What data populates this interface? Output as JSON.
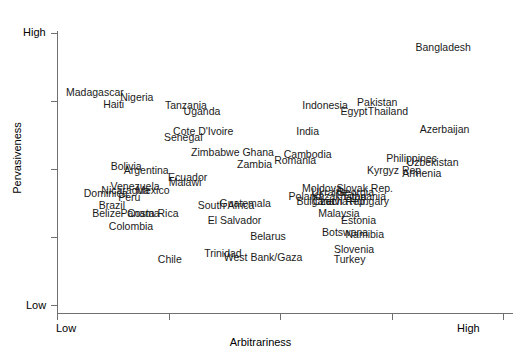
{
  "chart_data": {
    "type": "scatter",
    "title": "",
    "xlabel": "Arbitrariness",
    "ylabel": "Pervasiveness",
    "x_tick_labels": [
      "Low",
      "",
      "",
      "",
      "High"
    ],
    "y_tick_labels": [
      "High",
      "",
      "",
      "",
      "Low"
    ],
    "xlim": [
      "Low",
      "High"
    ],
    "ylim": [
      "Low",
      "High"
    ],
    "grid": false,
    "legend": "none",
    "note": "Text-label scatter: each country name is plotted at its (Arbitrariness, Pervasiveness) position. x/y given in normalized 0-1 units where 0=Low and 1=High.",
    "points": [
      {
        "label": "Bangladesh",
        "x": 0.866,
        "y": 0.948
      },
      {
        "label": "Madagascar",
        "x": 0.085,
        "y": 0.784
      },
      {
        "label": "Nigeria",
        "x": 0.179,
        "y": 0.766
      },
      {
        "label": "Haiti",
        "x": 0.127,
        "y": 0.738
      },
      {
        "label": "Tanzania",
        "x": 0.289,
        "y": 0.734
      },
      {
        "label": "Indonesia",
        "x": 0.601,
        "y": 0.734
      },
      {
        "label": "Pakistan",
        "x": 0.718,
        "y": 0.748
      },
      {
        "label": "Uganda",
        "x": 0.325,
        "y": 0.713
      },
      {
        "label": "Egypt",
        "x": 0.666,
        "y": 0.713
      },
      {
        "label": "Thailand",
        "x": 0.742,
        "y": 0.713
      },
      {
        "label": "Cote D'Ivoire",
        "x": 0.328,
        "y": 0.639
      },
      {
        "label": "India",
        "x": 0.562,
        "y": 0.639
      },
      {
        "label": "Azerbaijan",
        "x": 0.869,
        "y": 0.646
      },
      {
        "label": "Senegal",
        "x": 0.283,
        "y": 0.618
      },
      {
        "label": "Zimbabwe",
        "x": 0.355,
        "y": 0.561
      },
      {
        "label": "Ghana",
        "x": 0.451,
        "y": 0.561
      },
      {
        "label": "Cambodia",
        "x": 0.562,
        "y": 0.554
      },
      {
        "label": "Philippines",
        "x": 0.795,
        "y": 0.54
      },
      {
        "label": "Romania",
        "x": 0.534,
        "y": 0.533
      },
      {
        "label": "Uzbekistan",
        "x": 0.842,
        "y": 0.526
      },
      {
        "label": "Zambia",
        "x": 0.443,
        "y": 0.519
      },
      {
        "label": "Bolivia",
        "x": 0.155,
        "y": 0.512
      },
      {
        "label": "Argentina",
        "x": 0.2,
        "y": 0.498
      },
      {
        "label": "Kyrgyz Rep.",
        "x": 0.759,
        "y": 0.498
      },
      {
        "label": "Armenia",
        "x": 0.818,
        "y": 0.484
      },
      {
        "label": "Ecuador",
        "x": 0.293,
        "y": 0.47
      },
      {
        "label": "Malawi",
        "x": 0.287,
        "y": 0.452
      },
      {
        "label": "Venezuela",
        "x": 0.175,
        "y": 0.438
      },
      {
        "label": "Moldova",
        "x": 0.594,
        "y": 0.431
      },
      {
        "label": "Slovak Rep.",
        "x": 0.69,
        "y": 0.431
      },
      {
        "label": "Nicaragua",
        "x": 0.153,
        "y": 0.424
      },
      {
        "label": "Mexico",
        "x": 0.215,
        "y": 0.424
      },
      {
        "label": "Ukraine",
        "x": 0.611,
        "y": 0.417
      },
      {
        "label": "Georgia",
        "x": 0.669,
        "y": 0.417
      },
      {
        "label": "Dominica",
        "x": 0.109,
        "y": 0.41
      },
      {
        "label": "Poland",
        "x": 0.556,
        "y": 0.4
      },
      {
        "label": "Kazakhstan",
        "x": 0.632,
        "y": 0.4
      },
      {
        "label": "Lithuania",
        "x": 0.69,
        "y": 0.4
      },
      {
        "label": "Peru",
        "x": 0.162,
        "y": 0.396
      },
      {
        "label": "Bulgaria",
        "x": 0.58,
        "y": 0.382
      },
      {
        "label": "Czech Rep.",
        "x": 0.635,
        "y": 0.382
      },
      {
        "label": "Latvia",
        "x": 0.621,
        "y": 0.382
      },
      {
        "label": "Hungary",
        "x": 0.7,
        "y": 0.382
      },
      {
        "label": "Brazil",
        "x": 0.123,
        "y": 0.368
      },
      {
        "label": "South Africa",
        "x": 0.379,
        "y": 0.368
      },
      {
        "label": "Guatemala",
        "x": 0.422,
        "y": 0.375
      },
      {
        "label": "Belize",
        "x": 0.111,
        "y": 0.34
      },
      {
        "label": "Panama",
        "x": 0.186,
        "y": 0.34
      },
      {
        "label": "Costa Rica",
        "x": 0.215,
        "y": 0.34
      },
      {
        "label": "Malaysia",
        "x": 0.632,
        "y": 0.34
      },
      {
        "label": "El Salvador",
        "x": 0.398,
        "y": 0.312
      },
      {
        "label": "Estonia",
        "x": 0.676,
        "y": 0.312
      },
      {
        "label": "Colombia",
        "x": 0.166,
        "y": 0.291
      },
      {
        "label": "Botswana",
        "x": 0.646,
        "y": 0.269
      },
      {
        "label": "Namibia",
        "x": 0.69,
        "y": 0.262
      },
      {
        "label": "Belarus",
        "x": 0.473,
        "y": 0.255
      },
      {
        "label": "Slovenia",
        "x": 0.666,
        "y": 0.206
      },
      {
        "label": "Trinidad",
        "x": 0.372,
        "y": 0.191
      },
      {
        "label": "West Bank/Gaza",
        "x": 0.462,
        "y": 0.177
      },
      {
        "label": "Turkey",
        "x": 0.656,
        "y": 0.17
      },
      {
        "label": "Chile",
        "x": 0.253,
        "y": 0.17
      }
    ]
  }
}
